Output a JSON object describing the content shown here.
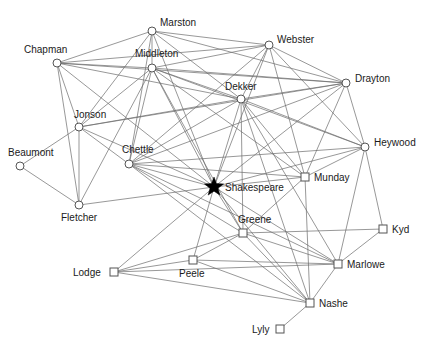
{
  "figure": {
    "title": "",
    "background_color": "#ffffff",
    "edge_color": "#6b6b6b",
    "node_stroke_color": "#555555",
    "node_fill_color": "#ffffff",
    "focal_node_color": "#000000",
    "label_color": "#1a1a1a"
  },
  "chart_data": {
    "type": "scatter",
    "title": "",
    "xlabel": "",
    "ylabel": "",
    "grid": false,
    "legend": "none",
    "node_shapes": {
      "circle": "open circle marker",
      "square": "open square marker",
      "star": "filled star marker (focal node)"
    },
    "nodes": [
      {
        "id": "Marston",
        "label": "Marston",
        "x": 152,
        "y": 31,
        "shape": "circle",
        "label_dx": 8,
        "label_dy": -5
      },
      {
        "id": "Chapman",
        "label": "Chapman",
        "x": 57,
        "y": 63,
        "shape": "circle",
        "label_dx": -33,
        "label_dy": -10
      },
      {
        "id": "Middleton",
        "label": "Middleton",
        "x": 152,
        "y": 68,
        "shape": "circle",
        "label_dx": -17,
        "label_dy": -11
      },
      {
        "id": "Webster",
        "label": "Webster",
        "x": 269,
        "y": 45,
        "shape": "circle",
        "label_dx": 8,
        "label_dy": -2
      },
      {
        "id": "Drayton",
        "label": "Drayton",
        "x": 346,
        "y": 83,
        "shape": "circle",
        "label_dx": 9,
        "label_dy": -1
      },
      {
        "id": "Dekker",
        "label": "Dekker",
        "x": 241,
        "y": 99,
        "shape": "circle",
        "label_dx": -16,
        "label_dy": -9
      },
      {
        "id": "Jonson",
        "label": "Jonson",
        "x": 79,
        "y": 127,
        "shape": "circle",
        "label_dx": -5,
        "label_dy": -9
      },
      {
        "id": "Heywood",
        "label": "Heywood",
        "x": 365,
        "y": 147,
        "shape": "circle",
        "label_dx": 9,
        "label_dy": -1
      },
      {
        "id": "Chettle",
        "label": "Chettle",
        "x": 129,
        "y": 164,
        "shape": "circle",
        "label_dx": -7,
        "label_dy": -11
      },
      {
        "id": "Beaumont",
        "label": "Beaumont",
        "x": 20,
        "y": 166,
        "shape": "circle",
        "label_dx": -12,
        "label_dy": -10
      },
      {
        "id": "Munday",
        "label": "Munday",
        "x": 305,
        "y": 177,
        "shape": "square",
        "label_dx": 9,
        "label_dy": 4
      },
      {
        "id": "Shakespeare",
        "label": "Shakespeare",
        "x": 214,
        "y": 187,
        "shape": "star",
        "label_dx": 11,
        "label_dy": 4
      },
      {
        "id": "Fletcher",
        "label": "Fletcher",
        "x": 79,
        "y": 205,
        "shape": "circle",
        "label_dx": -18,
        "label_dy": 16
      },
      {
        "id": "Greene",
        "label": "Greene",
        "x": 243,
        "y": 233,
        "shape": "square",
        "label_dx": -5,
        "label_dy": -10
      },
      {
        "id": "Kyd",
        "label": "Kyd",
        "x": 383,
        "y": 229,
        "shape": "square",
        "label_dx": 9,
        "label_dy": 4
      },
      {
        "id": "Marlowe",
        "label": "Marlowe",
        "x": 338,
        "y": 264,
        "shape": "square",
        "label_dx": 9,
        "label_dy": 4
      },
      {
        "id": "Lodge",
        "label": "Lodge",
        "x": 114,
        "y": 272,
        "shape": "square",
        "label_dx": -41,
        "label_dy": 4
      },
      {
        "id": "Peele",
        "label": "Peele",
        "x": 193,
        "y": 260,
        "shape": "square",
        "label_dx": -14,
        "label_dy": 17
      },
      {
        "id": "Nashe",
        "label": "Nashe",
        "x": 310,
        "y": 303,
        "shape": "square",
        "label_dx": 9,
        "label_dy": 4
      },
      {
        "id": "Lyly",
        "label": "Lyly",
        "x": 280,
        "y": 329,
        "shape": "square",
        "label_dx": -28,
        "label_dy": 4
      }
    ],
    "edges": [
      [
        "Marston",
        "Chapman"
      ],
      [
        "Marston",
        "Middleton"
      ],
      [
        "Marston",
        "Webster"
      ],
      [
        "Marston",
        "Dekker"
      ],
      [
        "Marston",
        "Drayton"
      ],
      [
        "Marston",
        "Jonson"
      ],
      [
        "Marston",
        "Chettle"
      ],
      [
        "Marston",
        "Shakespeare"
      ],
      [
        "Chapman",
        "Middleton"
      ],
      [
        "Chapman",
        "Jonson"
      ],
      [
        "Chapman",
        "Fletcher"
      ],
      [
        "Chapman",
        "Dekker"
      ],
      [
        "Chapman",
        "Drayton"
      ],
      [
        "Chapman",
        "Webster"
      ],
      [
        "Chapman",
        "Shakespeare"
      ],
      [
        "Middleton",
        "Webster"
      ],
      [
        "Middleton",
        "Dekker"
      ],
      [
        "Middleton",
        "Drayton"
      ],
      [
        "Middleton",
        "Heywood"
      ],
      [
        "Middleton",
        "Munday"
      ],
      [
        "Middleton",
        "Chettle"
      ],
      [
        "Middleton",
        "Jonson"
      ],
      [
        "Middleton",
        "Shakespeare"
      ],
      [
        "Middleton",
        "Fletcher"
      ],
      [
        "Middleton",
        "Greene"
      ],
      [
        "Webster",
        "Dekker"
      ],
      [
        "Webster",
        "Drayton"
      ],
      [
        "Webster",
        "Heywood"
      ],
      [
        "Webster",
        "Munday"
      ],
      [
        "Webster",
        "Chettle"
      ],
      [
        "Webster",
        "Shakespeare"
      ],
      [
        "Dekker",
        "Drayton"
      ],
      [
        "Dekker",
        "Heywood"
      ],
      [
        "Dekker",
        "Munday"
      ],
      [
        "Dekker",
        "Chettle"
      ],
      [
        "Dekker",
        "Jonson"
      ],
      [
        "Dekker",
        "Shakespeare"
      ],
      [
        "Dekker",
        "Marlowe"
      ],
      [
        "Dekker",
        "Nashe"
      ],
      [
        "Dekker",
        "Greene"
      ],
      [
        "Drayton",
        "Heywood"
      ],
      [
        "Drayton",
        "Munday"
      ],
      [
        "Drayton",
        "Chettle"
      ],
      [
        "Drayton",
        "Shakespeare"
      ],
      [
        "Drayton",
        "Jonson"
      ],
      [
        "Heywood",
        "Munday"
      ],
      [
        "Heywood",
        "Chettle"
      ],
      [
        "Heywood",
        "Shakespeare"
      ],
      [
        "Heywood",
        "Kyd"
      ],
      [
        "Heywood",
        "Marlowe"
      ],
      [
        "Munday",
        "Chettle"
      ],
      [
        "Munday",
        "Shakespeare"
      ],
      [
        "Munday",
        "Nashe"
      ],
      [
        "Munday",
        "Greene"
      ],
      [
        "Chettle",
        "Shakespeare"
      ],
      [
        "Chettle",
        "Greene"
      ],
      [
        "Chettle",
        "Marlowe"
      ],
      [
        "Chettle",
        "Nashe"
      ],
      [
        "Jonson",
        "Fletcher"
      ],
      [
        "Jonson",
        "Beaumont"
      ],
      [
        "Jonson",
        "Chettle"
      ],
      [
        "Jonson",
        "Shakespeare"
      ],
      [
        "Beaumont",
        "Fletcher"
      ],
      [
        "Fletcher",
        "Shakespeare"
      ],
      [
        "Shakespeare",
        "Greene"
      ],
      [
        "Shakespeare",
        "Peele"
      ],
      [
        "Shakespeare",
        "Lodge"
      ],
      [
        "Shakespeare",
        "Nashe"
      ],
      [
        "Shakespeare",
        "Marlowe"
      ],
      [
        "Greene",
        "Lodge"
      ],
      [
        "Greene",
        "Peele"
      ],
      [
        "Greene",
        "Nashe"
      ],
      [
        "Greene",
        "Marlowe"
      ],
      [
        "Greene",
        "Kyd"
      ],
      [
        "Kyd",
        "Marlowe"
      ],
      [
        "Marlowe",
        "Nashe"
      ],
      [
        "Marlowe",
        "Peele"
      ],
      [
        "Marlowe",
        "Lodge"
      ],
      [
        "Lodge",
        "Peele"
      ],
      [
        "Lodge",
        "Nashe"
      ],
      [
        "Peele",
        "Nashe"
      ],
      [
        "Nashe",
        "Lyly"
      ]
    ]
  }
}
